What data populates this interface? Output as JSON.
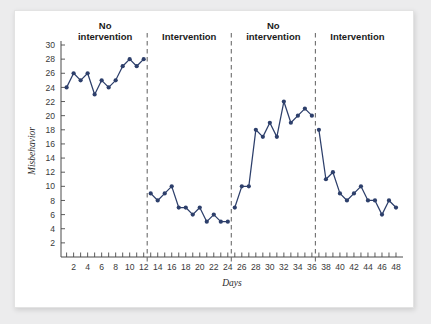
{
  "chart_data": {
    "type": "line",
    "title": "",
    "xlabel": "Days",
    "ylabel": "Misbehavior",
    "xlim": [
      0.2,
      49
    ],
    "ylim": [
      0,
      30
    ],
    "ytick_step": 2,
    "yticks": [
      2,
      4,
      6,
      8,
      10,
      12,
      14,
      16,
      18,
      20,
      22,
      24,
      26,
      28,
      30
    ],
    "xticks": [
      1,
      2,
      3,
      4,
      5,
      6,
      7,
      8,
      9,
      10,
      11,
      12,
      13,
      14,
      15,
      16,
      17,
      18,
      19,
      20,
      21,
      22,
      23,
      24,
      25,
      26,
      27,
      28,
      29,
      30,
      31,
      32,
      33,
      34,
      35,
      36,
      37,
      38,
      39,
      40,
      41,
      42,
      43,
      44,
      45,
      46,
      47,
      48
    ],
    "xtick_labels": [
      2,
      4,
      6,
      8,
      10,
      12,
      14,
      16,
      18,
      20,
      22,
      24,
      26,
      28,
      30,
      32,
      34,
      36,
      38,
      40,
      42,
      44,
      46,
      48
    ],
    "grid": false,
    "legend": "none",
    "series_color": "#2d3f6b",
    "marker": "circle",
    "x": [
      1,
      2,
      3,
      4,
      5,
      6,
      7,
      8,
      9,
      10,
      11,
      12,
      13,
      14,
      15,
      16,
      17,
      18,
      19,
      20,
      21,
      22,
      23,
      24,
      25,
      26,
      27,
      28,
      29,
      30,
      31,
      32,
      33,
      34,
      35,
      36,
      37,
      38,
      39,
      40,
      41,
      42,
      43,
      44,
      45,
      46,
      47,
      48
    ],
    "series": [
      {
        "name": "Misbehavior",
        "values": [
          24,
          26,
          25,
          26,
          23,
          25,
          24,
          25,
          27,
          28,
          27,
          28,
          9,
          8,
          9,
          10,
          7,
          7,
          6,
          7,
          5,
          6,
          5,
          5,
          7,
          10,
          10,
          18,
          17,
          19,
          17,
          22,
          19,
          20,
          21,
          20,
          18,
          11,
          12,
          9,
          8,
          9,
          10,
          8,
          8,
          6,
          8,
          7
        ]
      }
    ],
    "phases": [
      {
        "label_line1": "No",
        "label_line2": "intervention",
        "x_start": 1,
        "x_end": 12
      },
      {
        "label_line1": "",
        "label_line2": "Intervention",
        "x_start": 13,
        "x_end": 24
      },
      {
        "label_line1": "No",
        "label_line2": "intervention",
        "x_start": 25,
        "x_end": 36
      },
      {
        "label_line1": "",
        "label_line2": "Intervention",
        "x_start": 37,
        "x_end": 48
      }
    ],
    "phase_dividers": [
      12.5,
      24.5,
      36.5
    ],
    "segments": [
      {
        "from_index": 0,
        "to_index": 11
      },
      {
        "from_index": 12,
        "to_index": 23
      },
      {
        "from_index": 24,
        "to_index": 35
      },
      {
        "from_index": 36,
        "to_index": 47
      }
    ]
  }
}
